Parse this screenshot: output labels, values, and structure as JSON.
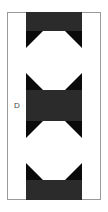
{
  "figure": {
    "label": "D",
    "frame_color": "#9a9a9a",
    "strip_color": "#2b2b2b",
    "cell_color": "#0a0a0a",
    "shape_color": "#ffffff",
    "shapes": [
      {
        "type": "octagon",
        "index": 1
      },
      {
        "type": "octagon",
        "index": 2
      }
    ]
  }
}
